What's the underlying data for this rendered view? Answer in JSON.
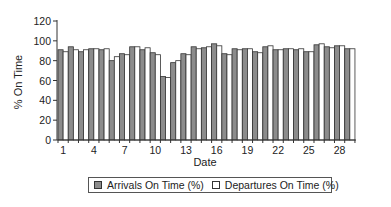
{
  "chart_data": {
    "type": "bar",
    "title": "",
    "xlabel": "Date",
    "ylabel": "% On Time",
    "ylim": [
      0,
      120
    ],
    "yticks": [
      0,
      20,
      40,
      60,
      80,
      100,
      120
    ],
    "xtick_labels": [
      "1",
      "4",
      "7",
      "10",
      "13",
      "16",
      "19",
      "22",
      "25",
      "28"
    ],
    "grid": false,
    "legend_position": "bottom",
    "categories": [
      1,
      2,
      3,
      4,
      5,
      6,
      7,
      8,
      9,
      10,
      11,
      12,
      13,
      14,
      15,
      16,
      17,
      18,
      19,
      20,
      21,
      22,
      23,
      24,
      25,
      26,
      27,
      28,
      29
    ],
    "series": [
      {
        "name": "Arrivals On Time (%)",
        "color": "#8c8c8c",
        "values": [
          91,
          94,
          89,
          92,
          91,
          80,
          87,
          94,
          91,
          88,
          64,
          78,
          87,
          94,
          93,
          97,
          87,
          92,
          92,
          89,
          94,
          91,
          92,
          91,
          89,
          96,
          94,
          95,
          92
        ]
      },
      {
        "name": "Departures On Time (%)",
        "color": "#ffffff",
        "values": [
          89,
          91,
          91,
          92,
          92,
          84,
          86,
          94,
          93,
          86,
          63,
          80,
          86,
          92,
          94,
          95,
          86,
          91,
          92,
          88,
          95,
          91,
          92,
          92,
          89,
          97,
          93,
          95,
          92
        ]
      }
    ]
  },
  "legend": {
    "arrivals_label": "Arrivals On Time (%)",
    "departures_label": "Departures On Time (%)"
  }
}
